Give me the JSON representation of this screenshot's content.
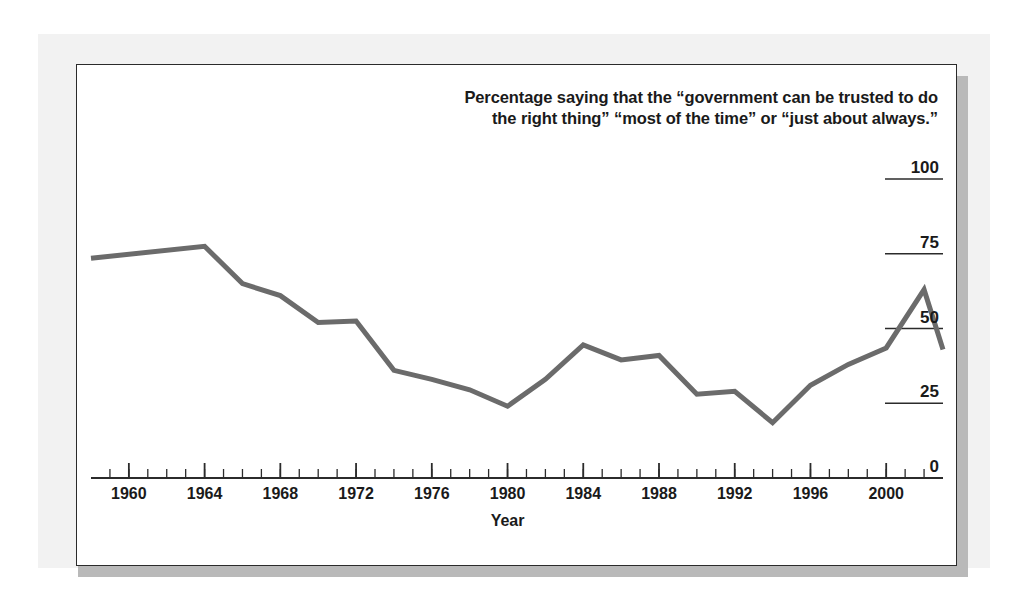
{
  "chart_data": {
    "type": "line",
    "title": "Percentage saying that the “government can be trusted to do the right thing” “most of the time” or “just about always.”",
    "title_line1": "Percentage saying that the “government can be trusted to do",
    "title_line2": "the right thing” “most of the time” or “just about always.”",
    "xlabel": "Year",
    "ylabel": "",
    "xlim": [
      1958,
      2003
    ],
    "ylim": [
      0,
      100
    ],
    "grid": false,
    "legend": null,
    "y_ticks": [
      0,
      25,
      50,
      75,
      100
    ],
    "y_tick_labels": [
      "0",
      "25",
      "50",
      "75",
      "100"
    ],
    "y_axis_position": "right",
    "x_ticks_major": [
      1960,
      1964,
      1968,
      1972,
      1976,
      1980,
      1984,
      1988,
      1992,
      1996,
      2000
    ],
    "x_tick_labels": [
      "1960",
      "1964",
      "1968",
      "1972",
      "1976",
      "1980",
      "1984",
      "1988",
      "1992",
      "1996",
      "2000"
    ],
    "x_minor_tick_interval": 1,
    "line_color": "#6b6b6b",
    "line_width": 5,
    "x": [
      1958,
      1964,
      1966,
      1968,
      1970,
      1972,
      1974,
      1976,
      1978,
      1980,
      1982,
      1984,
      1986,
      1988,
      1990,
      1992,
      1994,
      1996,
      1998,
      2000,
      2002,
      2003
    ],
    "values": [
      73.5,
      77.5,
      65,
      61,
      52,
      52.5,
      36,
      33,
      29.5,
      24,
      33,
      44.5,
      39.5,
      41,
      28,
      29,
      18.5,
      31,
      38,
      43.5,
      63,
      43
    ],
    "series": [
      {
        "name": "Trust in government",
        "values": [
          73.5,
          77.5,
          65,
          61,
          52,
          52.5,
          36,
          33,
          29.5,
          24,
          33,
          44.5,
          39.5,
          41,
          28,
          29,
          18.5,
          31,
          38,
          43.5,
          63,
          43
        ]
      }
    ]
  },
  "figure": {
    "background_color": "#ffffff",
    "panel_color": "#f2f2f2",
    "frame_border_color": "#2b2b2b",
    "shadow_color": "#b9b9b9"
  }
}
